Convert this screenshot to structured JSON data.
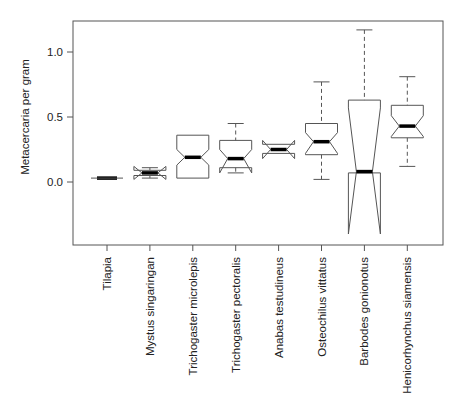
{
  "chart_data": {
    "type": "boxplot",
    "notched": true,
    "title": "",
    "xlabel": "",
    "ylabel": "Metacercaria per gram",
    "ylim": [
      -0.45,
      1.23
    ],
    "yticks": [
      0.0,
      0.5,
      1.0
    ],
    "ytick_labels": [
      "0.0",
      "0.5",
      "1.0"
    ],
    "grid": false,
    "legend": null,
    "categories": [
      "Tilapia",
      "Mystus singaringan",
      "Trichogaster microlepis",
      "Trichogaster pectoralis",
      "Anabas testudineus",
      "Osteochilus vittatus",
      "Barbodes gonionotus",
      "Henicorhynchus siamensis"
    ],
    "boxes": [
      {
        "name": "Tilapia",
        "whisker_low": 0.03,
        "q1": 0.03,
        "median": 0.03,
        "q3": 0.03,
        "whisker_high": 0.03,
        "notch_low": 0.025,
        "notch_high": 0.035
      },
      {
        "name": "Mystus singaringan",
        "whisker_low": 0.03,
        "q1": 0.05,
        "median": 0.07,
        "q3": 0.09,
        "whisker_high": 0.11,
        "notch_low": 0.02,
        "notch_high": 0.12
      },
      {
        "name": "Trichogaster microlepis",
        "whisker_low": 0.03,
        "q1": 0.03,
        "median": 0.19,
        "q3": 0.36,
        "whisker_high": 0.36,
        "notch_low": 0.13,
        "notch_high": 0.25
      },
      {
        "name": "Trichogaster pectoralis",
        "whisker_low": 0.07,
        "q1": 0.11,
        "median": 0.18,
        "q3": 0.32,
        "whisker_high": 0.45,
        "notch_low": 0.07,
        "notch_high": 0.25
      },
      {
        "name": "Anabas testudineus",
        "whisker_low": 0.22,
        "q1": 0.22,
        "median": 0.25,
        "q3": 0.29,
        "whisker_high": 0.29,
        "notch_low": 0.18,
        "notch_high": 0.32
      },
      {
        "name": "Osteochilus vittatus",
        "whisker_low": 0.02,
        "q1": 0.21,
        "median": 0.31,
        "q3": 0.45,
        "whisker_high": 0.77,
        "notch_low": 0.22,
        "notch_high": 0.38
      },
      {
        "name": "Barbodes gonionotus",
        "whisker_low": 0.07,
        "q1": 0.07,
        "median": 0.08,
        "q3": 0.63,
        "whisker_high": 1.17,
        "notch_low": -0.4,
        "notch_high": 0.57
      },
      {
        "name": "Henicorhynchus siamensis",
        "whisker_low": 0.12,
        "q1": 0.34,
        "median": 0.43,
        "q3": 0.59,
        "whisker_high": 0.81,
        "notch_low": 0.35,
        "notch_high": 0.51
      }
    ]
  },
  "colors": {
    "box_stroke": "#555555",
    "median": "#000000",
    "axis": "#555555",
    "text": "#222222"
  }
}
